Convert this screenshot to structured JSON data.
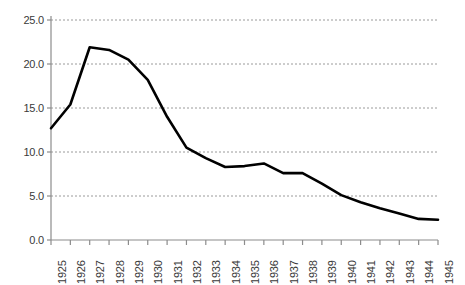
{
  "chart_data": {
    "type": "line",
    "title": "",
    "subtitle": "",
    "xlabel": "",
    "ylabel": "",
    "grid": "horizontal",
    "legend": "none",
    "xlim": [
      1925,
      1945
    ],
    "ylim": [
      0.0,
      25.0
    ],
    "ytick_step": 5.0,
    "yticks": [
      "0.0",
      "5.0",
      "10.0",
      "15.0",
      "20.0",
      "25.0"
    ],
    "ytick_values": [
      0.0,
      5.0,
      10.0,
      15.0,
      20.0,
      25.0
    ],
    "categories": [
      "1925",
      "1926",
      "1927",
      "1928",
      "1929",
      "1930",
      "1931",
      "1932",
      "1933",
      "1934",
      "1935",
      "1936",
      "1937",
      "1938",
      "1939",
      "1940",
      "1941",
      "1942",
      "1943",
      "1944",
      "1945"
    ],
    "x": [
      1925,
      1926,
      1927,
      1928,
      1929,
      1930,
      1931,
      1932,
      1933,
      1934,
      1935,
      1936,
      1937,
      1938,
      1939,
      1940,
      1941,
      1942,
      1943,
      1944,
      1945
    ],
    "values": [
      12.7,
      15.4,
      21.9,
      21.6,
      20.5,
      18.2,
      14.0,
      10.5,
      9.3,
      8.3,
      8.4,
      8.7,
      7.6,
      7.6,
      6.4,
      5.1,
      4.3,
      3.6,
      3.0,
      2.4,
      2.3
    ],
    "series": [
      {
        "name": "series-1",
        "color": "#000000",
        "values": [
          12.7,
          15.4,
          21.9,
          21.6,
          20.5,
          18.2,
          14.0,
          10.5,
          9.3,
          8.3,
          8.4,
          8.7,
          7.6,
          7.6,
          6.4,
          5.1,
          4.3,
          3.6,
          3.0,
          2.4,
          2.3
        ]
      }
    ]
  },
  "style": {
    "line_color": "#000000",
    "grid_color": "#9a9a9a",
    "axis_color": "#8c8c8c",
    "tick_label_color": "#3a3a3a",
    "background": "#ffffff"
  }
}
